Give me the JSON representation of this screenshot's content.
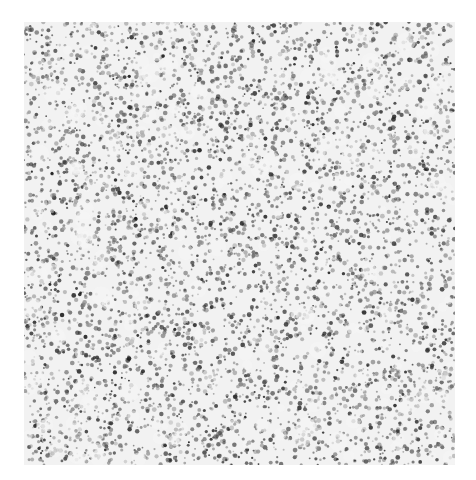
{
  "image": {
    "kind": "grayscale micrograph",
    "description": "Dense speckled texture of dark particle clusters on a light background",
    "bounds": {
      "x": 24,
      "y": 22,
      "width": 431,
      "height": 443
    },
    "colors": {
      "background": "#ffffff",
      "field": "#f2f2f2",
      "particle_dark": "#1e1e1e",
      "particle_mid": "#6a6a6a"
    },
    "density": 0.5
  }
}
